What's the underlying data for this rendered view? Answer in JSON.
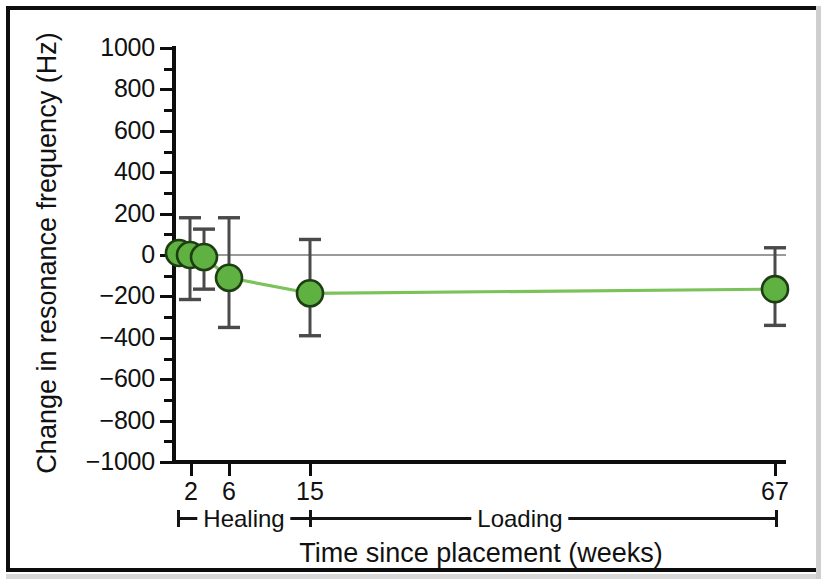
{
  "figure": {
    "background": "#ffffff",
    "frame_color": "#0d0d0d"
  },
  "chart_data": {
    "type": "line",
    "title": "",
    "xlabel": "Time since placement (weeks)",
    "ylabel": "Change in resonance frequency (Hz)",
    "x": [
      1,
      2,
      6,
      15,
      67
    ],
    "x_tick_values": [
      2,
      6,
      15,
      67
    ],
    "x_tick_labels": [
      "2",
      "6",
      "15",
      "67"
    ],
    "y_tick_labels": [
      "1000",
      "800",
      "600",
      "400",
      "200",
      "0",
      "−200",
      "−400",
      "−600",
      "−800",
      "−1000"
    ],
    "y_tick_values": [
      1000,
      800,
      600,
      400,
      200,
      0,
      -200,
      -400,
      -600,
      -800,
      -1000
    ],
    "ylim": [
      -1000,
      1000
    ],
    "minor_tick_step": 100,
    "grid": false,
    "legend": false,
    "zero_reference_line": true,
    "zero_line_color": "#9a9a9a",
    "series": [
      {
        "name": "Change in resonance frequency",
        "marker": "circle",
        "marker_color": "#5fb141",
        "marker_edge_color": "#1d3d12",
        "line_color": "#7cc25a",
        "errorbar_color": "#4a4a4a",
        "points": [
          {
            "x": 0.6,
            "label": "0",
            "y": 10,
            "err_low": 10,
            "err_high": 10,
            "px": 3
          },
          {
            "x": 1.2,
            "label": "1",
            "y": 0,
            "err_low": 215,
            "err_high": 180,
            "px": 14
          },
          {
            "x": 2,
            "label": "2",
            "y": -10,
            "err_low": 155,
            "err_high": 135,
            "px": 28
          },
          {
            "x": 6,
            "label": "6",
            "y": -110,
            "err_low": 240,
            "err_high": 290,
            "px": 53
          },
          {
            "x": 15,
            "label": "15",
            "y": -185,
            "err_low": 205,
            "err_high": 260,
            "px": 134
          },
          {
            "x": 67,
            "label": "67",
            "y": -165,
            "err_low": 175,
            "err_high": 200,
            "px": 599
          }
        ]
      }
    ],
    "annotations": [
      {
        "text": "Healing",
        "type": "phase-bracket",
        "from_week": 2,
        "to_week": 15
      },
      {
        "text": "Loading",
        "type": "phase-bracket",
        "from_week": 15,
        "to_week": 67
      }
    ]
  },
  "phases": {
    "healing_label": "Healing",
    "loading_label": "Loading"
  }
}
